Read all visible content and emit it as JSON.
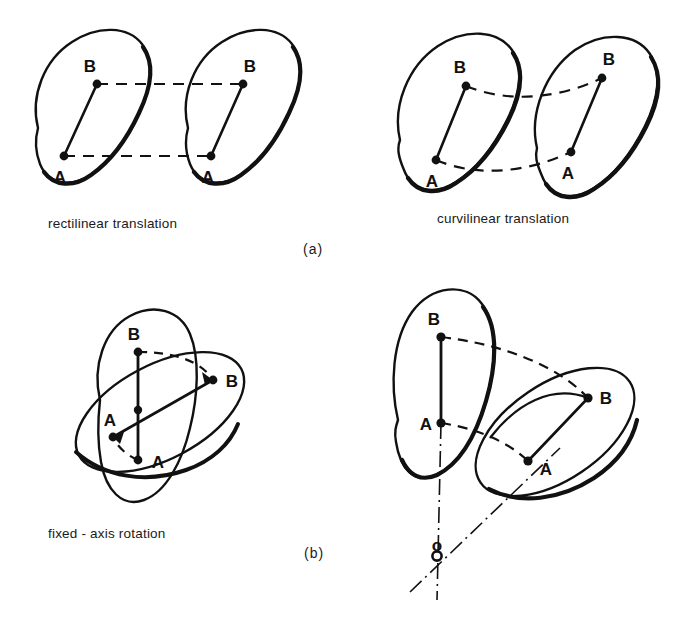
{
  "figure": {
    "background_color": "#ffffff",
    "ink_color": "#111111",
    "point_labels": {
      "a": "A",
      "b": "B",
      "pivot": "o"
    },
    "panels": [
      {
        "id": "rectilinear-translation",
        "caption": "rectilinear translation",
        "group": "(a)",
        "motion_type": "translation",
        "path_style": "straight dashed",
        "bodies": 2,
        "points": [
          "A",
          "B"
        ]
      },
      {
        "id": "curvilinear-translation",
        "caption": "curvilinear translation",
        "group": "(a)",
        "motion_type": "translation",
        "path_style": "curved dashed",
        "bodies": 2,
        "points": [
          "A",
          "B"
        ]
      },
      {
        "id": "fixed-axis-rotation",
        "caption": "fixed - axis rotation",
        "group": "(b)",
        "motion_type": "rotation",
        "path_style": "curved dashed arcs about shared center",
        "bodies": 2,
        "points": [
          "A",
          "B"
        ]
      },
      {
        "id": "general-plane-motion",
        "caption": "",
        "group": "(b)",
        "motion_type": "rotation about external axis",
        "path_style": "curved dashed with dash-dot centerlines",
        "bodies": 2,
        "points": [
          "A",
          "B",
          "o"
        ]
      }
    ],
    "group_markers": [
      {
        "id": "marker-a",
        "label": "(a)"
      },
      {
        "id": "marker-b",
        "label": "(b)"
      }
    ]
  }
}
